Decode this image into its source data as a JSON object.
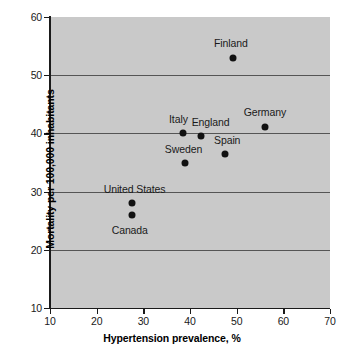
{
  "chart_data": {
    "type": "scatter",
    "title": "",
    "xlabel": "Hypertension prevalence, %",
    "ylabel": "Mortality per 100,000 inhabitants",
    "xlim": [
      10,
      70
    ],
    "ylim": [
      10,
      60
    ],
    "xticks": [
      10,
      20,
      30,
      40,
      50,
      60,
      70
    ],
    "yticks": [
      10,
      20,
      30,
      40,
      50,
      60
    ],
    "xticklabels": [
      "10",
      "20",
      "30",
      "40",
      "50",
      "60",
      "70"
    ],
    "yticklabels": [
      "10",
      "20",
      "30",
      "40",
      "50",
      "60"
    ],
    "grid": "horizontal",
    "gridlines_y": [
      20,
      30,
      40,
      50
    ],
    "legend": "none",
    "plot_background": "#c9c9c9",
    "figure_background": "#ffffff",
    "marker_color": "#111111",
    "gridline_color": "#555555",
    "axis_color": "#1a1a1a",
    "points": [
      {
        "label": "Finland",
        "x": 49.2,
        "y": 53.0,
        "label_dx": -2,
        "label_dy": -15,
        "label_align": "center"
      },
      {
        "label": "Germany",
        "x": 56.0,
        "y": 41.1,
        "label_dx": 0,
        "label_dy": -15,
        "label_align": "center"
      },
      {
        "label": "England",
        "x": 42.3,
        "y": 39.5,
        "label_dx": 10,
        "label_dy": -14,
        "label_align": "center"
      },
      {
        "label": "Italy",
        "x": 38.4,
        "y": 40.0,
        "label_dx": -4,
        "label_dy": -14,
        "label_align": "center"
      },
      {
        "label": "Spain",
        "x": 47.5,
        "y": 36.4,
        "label_dx": 2,
        "label_dy": -14,
        "label_align": "center"
      },
      {
        "label": "Sweden",
        "x": 39.0,
        "y": 35.0,
        "label_dx": -2,
        "label_dy": -14,
        "label_align": "center"
      },
      {
        "label": "United States",
        "x": 27.5,
        "y": 28.0,
        "label_dx": 3,
        "label_dy": -14,
        "label_align": "center"
      },
      {
        "label": "Canada",
        "x": 27.5,
        "y": 26.0,
        "label_dx": -2,
        "label_dy": 15,
        "label_align": "center"
      }
    ]
  }
}
